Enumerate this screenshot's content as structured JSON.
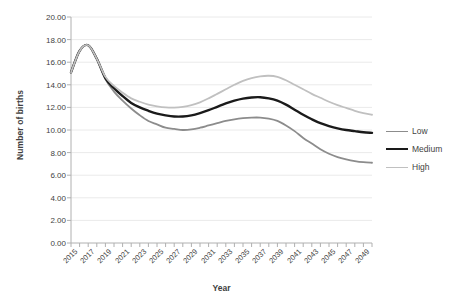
{
  "chart_data": {
    "type": "line",
    "title": "",
    "xlabel": "Year",
    "ylabel": "Number of births",
    "ylim": [
      0,
      20
    ],
    "xlim": [
      2015,
      2050
    ],
    "ytick_step": 2,
    "grid": true,
    "legend_position": "right",
    "x": [
      2015,
      2016,
      2017,
      2018,
      2019,
      2020,
      2021,
      2022,
      2023,
      2024,
      2025,
      2026,
      2027,
      2028,
      2029,
      2030,
      2031,
      2032,
      2033,
      2034,
      2035,
      2036,
      2037,
      2038,
      2039,
      2040,
      2041,
      2042,
      2043,
      2044,
      2045,
      2046,
      2047,
      2048,
      2049,
      2050
    ],
    "xticks": [
      "2015",
      "2017",
      "2019",
      "2021",
      "2023",
      "2025",
      "2027",
      "2029",
      "2031",
      "2033",
      "2035",
      "2037",
      "2039",
      "2041",
      "2043",
      "2045",
      "2047",
      "2049"
    ],
    "yticks": [
      "0.00",
      "2.00",
      "4.00",
      "6.00",
      "8.00",
      "10.00",
      "12.00",
      "14.00",
      "16.00",
      "18.00",
      "20.00"
    ],
    "series": [
      {
        "name": "Low",
        "color": "#8c8c8c",
        "width": 1.8,
        "values": [
          15.1,
          17.0,
          17.5,
          16.3,
          14.5,
          13.4,
          12.6,
          11.9,
          11.3,
          10.8,
          10.5,
          10.2,
          10.1,
          10.0,
          10.05,
          10.2,
          10.4,
          10.6,
          10.8,
          10.95,
          11.05,
          11.1,
          11.1,
          11.0,
          10.8,
          10.4,
          9.9,
          9.3,
          8.8,
          8.3,
          7.9,
          7.6,
          7.4,
          7.25,
          7.15,
          7.1
        ]
      },
      {
        "name": "Medium",
        "color": "#1a1a1a",
        "width": 2.4,
        "values": [
          15.1,
          17.0,
          17.5,
          16.3,
          14.6,
          13.7,
          13.0,
          12.4,
          12.0,
          11.7,
          11.45,
          11.3,
          11.2,
          11.2,
          11.3,
          11.5,
          11.75,
          12.05,
          12.35,
          12.6,
          12.78,
          12.88,
          12.9,
          12.8,
          12.6,
          12.25,
          11.8,
          11.35,
          10.95,
          10.6,
          10.35,
          10.15,
          10.0,
          9.9,
          9.8,
          9.75
        ]
      },
      {
        "name": "High",
        "color": "#c0c0c0",
        "width": 1.8,
        "values": [
          15.1,
          17.0,
          17.5,
          16.3,
          14.7,
          13.9,
          13.3,
          12.8,
          12.5,
          12.25,
          12.1,
          12.0,
          11.98,
          12.05,
          12.2,
          12.45,
          12.8,
          13.2,
          13.6,
          14.0,
          14.35,
          14.6,
          14.75,
          14.8,
          14.7,
          14.4,
          14.0,
          13.6,
          13.2,
          12.85,
          12.5,
          12.2,
          11.95,
          11.7,
          11.5,
          11.35
        ]
      }
    ]
  },
  "legend": {
    "items": [
      {
        "label": "Low"
      },
      {
        "label": "Medium"
      },
      {
        "label": "High"
      }
    ]
  },
  "axes": {
    "x_title": "Year",
    "y_title": "Number of births"
  },
  "colors": {
    "low": "#8c8c8c",
    "medium": "#1a1a1a",
    "high": "#c0c0c0",
    "grid": "#eaeaea",
    "axis": "#b0b0b0",
    "text": "#3f3f3f"
  }
}
